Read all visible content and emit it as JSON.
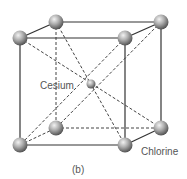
{
  "diagram": {
    "type": "crystal-lattice",
    "structure": "body-centered cubic (CsCl)",
    "labels": {
      "center_atom": "Cesium",
      "corner_atom": "Chlorine",
      "caption": "(b)"
    },
    "colors": {
      "edge": "#333333",
      "dashed": "#444444",
      "atom_light": "#eeeeee",
      "atom_mid": "#a8a8a8",
      "atom_dark": "#555555",
      "label_text": "#555555"
    },
    "atoms": {
      "corners": [
        {
          "id": "front-top-left",
          "x": 20,
          "y": 38
        },
        {
          "id": "front-top-right",
          "x": 125,
          "y": 38
        },
        {
          "id": "back-top-left",
          "x": 55,
          "y": 22
        },
        {
          "id": "back-top-right",
          "x": 161,
          "y": 22
        },
        {
          "id": "front-bottom-left",
          "x": 20,
          "y": 145
        },
        {
          "id": "front-bottom-right",
          "x": 125,
          "y": 145
        },
        {
          "id": "back-bottom-left",
          "x": 56,
          "y": 128
        },
        {
          "id": "back-bottom-right",
          "x": 161,
          "y": 128
        }
      ],
      "center": {
        "id": "cesium",
        "x": 91,
        "y": 84
      }
    }
  }
}
